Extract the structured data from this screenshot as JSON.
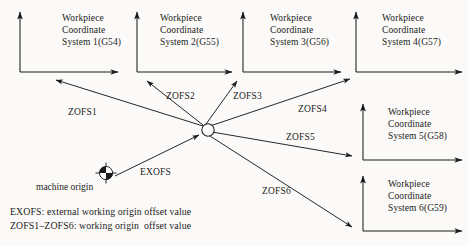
{
  "diagram": {
    "background_color": "#fbfaf8",
    "line_color": "#1b1b1b",
    "text_color": "#1b1b1b"
  },
  "coordinate_systems": [
    {
      "id": "g54",
      "line1": "Workpiece",
      "line2": "Coordinate",
      "line3": "System 1(G54)",
      "code": "G54",
      "index": 1,
      "origin": {
        "x": 20,
        "y": 72
      }
    },
    {
      "id": "g55",
      "line1": "Workpiece",
      "line2": "Coordinate",
      "line3": "System 2(G55)",
      "code": "G55",
      "index": 2,
      "origin": {
        "x": 137,
        "y": 72
      }
    },
    {
      "id": "g56",
      "line1": "Workpiece",
      "line2": "Coordinate",
      "line3": "System 3(G56)",
      "code": "G56",
      "index": 3,
      "origin": {
        "x": 243,
        "y": 72
      }
    },
    {
      "id": "g57",
      "line1": "Workpiece",
      "line2": "Coordinate",
      "line3": "System 4(G57)",
      "code": "G57",
      "index": 4,
      "origin": {
        "x": 356,
        "y": 72
      }
    },
    {
      "id": "g58",
      "line1": "Workpiece",
      "line2": "Coordinate",
      "line3": "System 5(G58)",
      "code": "G58",
      "index": 5,
      "origin": {
        "x": 363,
        "y": 160
      }
    },
    {
      "id": "g59",
      "line1": "Workpiece",
      "line2": "Coordinate",
      "line3": "System 6(G59)",
      "code": "G59",
      "index": 6,
      "origin": {
        "x": 363,
        "y": 231
      }
    }
  ],
  "offset_vectors": [
    {
      "id": "zofs1",
      "label": "ZOFS1",
      "from": "hub",
      "to": "g54"
    },
    {
      "id": "zofs2",
      "label": "ZOFS2",
      "from": "hub",
      "to": "g55"
    },
    {
      "id": "zofs3",
      "label": "ZOFS3",
      "from": "hub",
      "to": "g56"
    },
    {
      "id": "zofs4",
      "label": "ZOFS4",
      "from": "hub",
      "to": "g57"
    },
    {
      "id": "zofs5",
      "label": "ZOFS5",
      "from": "hub",
      "to": "g58"
    },
    {
      "id": "zofs6",
      "label": "ZOFS6",
      "from": "hub",
      "to": "g59"
    },
    {
      "id": "exofs",
      "label": "EXOFS",
      "from": "machine-origin",
      "to": "hub"
    }
  ],
  "machine_origin": {
    "label": "machine origin",
    "symbol": "machine-origin-icon",
    "position": {
      "x": 106,
      "y": 173
    }
  },
  "hub": {
    "name": "external-origin-node",
    "position": {
      "x": 208,
      "y": 130
    },
    "radius": 6
  },
  "legend": {
    "line1": "EXOFS: external working origin offset value",
    "line2": "ZOFS1–ZOFS6: working origin  offset value"
  }
}
